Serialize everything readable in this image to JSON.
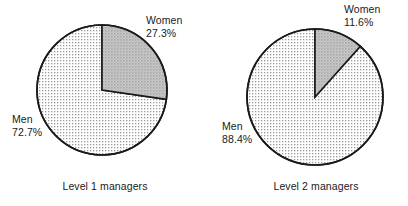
{
  "chart_data": [
    {
      "type": "pie",
      "title": "Level 1 managers",
      "categories": [
        "Women",
        "Men"
      ],
      "values": [
        27.3,
        72.7
      ],
      "value_labels": [
        "27.3%",
        "11.6%"
      ],
      "slices": [
        {
          "label": "Women",
          "value": 27.3,
          "value_label": "27.3%",
          "fill": "#bdbdbd",
          "start_deg": 0,
          "sweep_deg": 98.3
        },
        {
          "label": "Men",
          "value": 72.7,
          "value_label": "72.7%",
          "fill": "#e8e8e8",
          "start_deg": 98.3,
          "sweep_deg": 261.7
        }
      ],
      "legend_position": "callout-labels",
      "grid": false,
      "units": "percent"
    },
    {
      "type": "pie",
      "title": "Level 2 managers",
      "categories": [
        "Women",
        "Men"
      ],
      "values": [
        11.6,
        88.4
      ],
      "value_labels": [
        "11.6%",
        "88.4%"
      ],
      "slices": [
        {
          "label": "Women",
          "value": 11.6,
          "value_label": "11.6%",
          "fill": "#bdbdbd",
          "start_deg": 0,
          "sweep_deg": 41.8
        },
        {
          "label": "Men",
          "value": 88.4,
          "value_label": "88.4%",
          "fill": "#e8e8e8",
          "start_deg": 41.8,
          "sweep_deg": 318.2
        }
      ],
      "legend_position": "callout-labels",
      "grid": false,
      "units": "percent"
    }
  ],
  "figure": {
    "background": "#ffffff",
    "outline_color": "#1a1a1a",
    "left_chart": {
      "caption": "Level 1 managers",
      "women": {
        "name": "Women",
        "percent": "27.3%"
      },
      "men": {
        "name": "Men",
        "percent": "72.7%"
      }
    },
    "right_chart": {
      "caption": "Level 2 managers",
      "women": {
        "name": "Women",
        "percent": "11.6%"
      },
      "men": {
        "name": "Men",
        "percent": "88.4%"
      }
    }
  }
}
